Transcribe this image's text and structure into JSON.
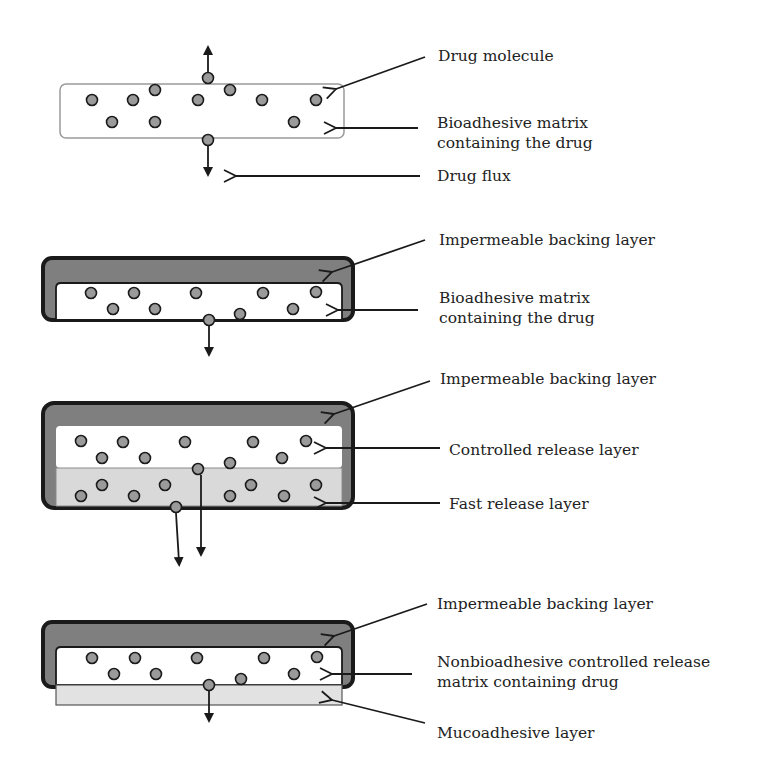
{
  "colors": {
    "background": "#ffffff",
    "backing_layer": "#7f7f7f",
    "controlled_release_layer": "#ffffff",
    "fast_release_layer": "#d9d9d9",
    "mucoadhesive_layer": "#e2e2e2",
    "drug_molecule": "#9a9a9a",
    "outline": "#1a1a1a",
    "text": "#222222"
  },
  "panels": [
    {
      "id": "monolithic-matrix",
      "labels": [
        {
          "text": "Drug molecule"
        },
        {
          "text": "Bioadhesive matrix",
          "text2": "containing the drug"
        },
        {
          "text": "Drug flux"
        }
      ]
    },
    {
      "id": "backed-matrix",
      "labels": [
        {
          "text": "Impermeable backing layer"
        },
        {
          "text": "Bioadhesive matrix",
          "text2": "containing the drug"
        }
      ]
    },
    {
      "id": "bilayer-release",
      "labels": [
        {
          "text": "Impermeable backing layer"
        },
        {
          "text": "Controlled release layer"
        },
        {
          "text": "Fast release layer"
        }
      ]
    },
    {
      "id": "mucoadhesive-bilayer",
      "labels": [
        {
          "text": "Impermeable backing layer"
        },
        {
          "text": "Nonbioadhesive controlled release",
          "text2": "matrix containing drug"
        },
        {
          "text": "Mucoadhesive layer"
        }
      ]
    }
  ]
}
